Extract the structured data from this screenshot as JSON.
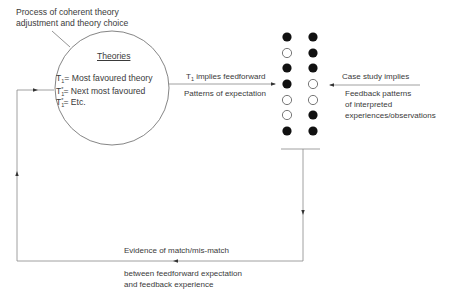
{
  "annotation": {
    "line1": "Process of coherent theory",
    "line2": "adjustment and theory choice"
  },
  "circle": {
    "title": "Theories",
    "items": [
      {
        "symbol": "T",
        "subscript": "1",
        "superscript": "",
        "text": "= Most favoured theory"
      },
      {
        "symbol": "T",
        "subscript": "1",
        "superscript": "*",
        "text": "= Next most favoured"
      },
      {
        "symbol": "T",
        "subscript": "1",
        "superscript": "*",
        "text": "= Etc."
      }
    ]
  },
  "feedforward": {
    "label_symbol": "T",
    "label_subscript": "1",
    "label_text": " implies feedforward",
    "below": "Patterns of expectation"
  },
  "feedback": {
    "label": "Case study implies",
    "below": [
      "Feedback patterns",
      "of interpreted",
      "experiences/observations"
    ]
  },
  "patterns": {
    "left_column": [
      "filled",
      "open",
      "filled",
      "filled",
      "open",
      "open",
      "filled"
    ],
    "right_column": [
      "filled",
      "filled",
      "filled",
      "open",
      "open",
      "filled",
      "filled"
    ]
  },
  "loop": {
    "above": "Evidence of match/mis-match",
    "below": [
      "between feedforward expectation",
      "and feedback experience"
    ]
  },
  "colors": {
    "line": "#7a7a7a",
    "dot": "#111111",
    "text": "#3a3a3a"
  }
}
